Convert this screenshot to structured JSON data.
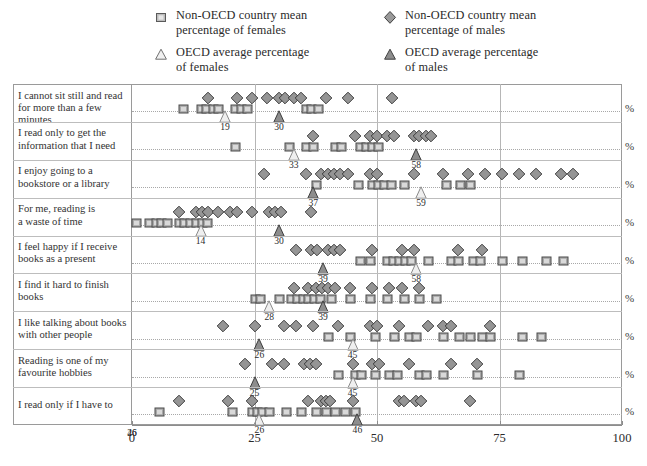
{
  "legend": {
    "items": [
      {
        "symbol": "square-light",
        "label": "Non-OECD country mean\npercentage of females",
        "name": "legend-nonoecd-females"
      },
      {
        "symbol": "diamond-dark",
        "label": "Non-OECD country mean\npercentage of males",
        "name": "legend-nonoecd-males"
      },
      {
        "symbol": "triangle-light",
        "label": "OECD average percentage\nof females",
        "name": "legend-oecd-females"
      },
      {
        "symbol": "triangle-dark",
        "label": "OECD average percentage\nof males",
        "name": "legend-oecd-males"
      }
    ]
  },
  "axis": {
    "ticks": [
      "0",
      "25",
      "50",
      "75",
      "100"
    ],
    "tick_values": [
      0,
      25,
      50,
      75,
      100
    ],
    "unit_label": "%",
    "extra_tick_labels": [
      {
        "value": 26,
        "text": "26"
      },
      {
        "value": 46,
        "text": "46"
      }
    ]
  },
  "chart_data": {
    "type": "scatter",
    "title": "",
    "xlabel": "%",
    "ylabel": "",
    "xlim": [
      0,
      100
    ],
    "grid": true,
    "legend_position": "top",
    "categories": [
      "I cannot sit still and read\nfor more than a few minutes",
      "I read only to get the\ninformation that I need",
      "I enjoy going to a\nbookstore or a library",
      "For me, reading is\na waste of time",
      "I feel happy if I receive\nbooks as a present",
      "I find it hard to finish\nbooks",
      "I like talking about books\nwith other people",
      "Reading is one of my\nfavourite hobbies",
      "I read only if I have to"
    ],
    "series": [
      {
        "name": "Non-OECD country mean percentage of females",
        "symbol": "square-light",
        "values": [
          [
            10.5,
            14.0,
            15.2,
            16.5,
            17.6,
            21.0,
            22.2,
            23.4,
            35.5,
            36.6,
            38.0
          ],
          [
            21.0,
            32.0,
            35.5,
            37.0,
            41.5,
            42.7,
            46.5,
            47.8,
            49.0,
            50.2
          ],
          [
            37.5,
            46.2,
            49.0,
            50.3,
            51.5,
            52.8,
            55.5,
            64.0,
            67.0,
            69.0
          ],
          [
            0.8,
            3.5,
            4.8,
            6.0,
            7.2,
            9.5,
            10.6,
            11.8,
            13.0,
            14.2,
            15.3
          ],
          [
            46.5,
            48.5,
            52.0,
            53.3,
            54.5,
            55.8,
            57.0,
            60.5,
            65.0,
            66.5,
            69.5,
            71.0,
            75.5,
            79.5,
            84.5,
            88.0
          ],
          [
            25.0,
            26.2,
            30.0,
            32.5,
            33.6,
            34.8,
            36.0,
            37.2,
            38.4,
            40.6,
            44.5,
            48.5,
            52.0,
            55.5,
            58.5,
            62.0
          ],
          [
            40.0,
            44.5,
            49.5,
            53.5,
            56.5,
            58.0,
            63.5,
            66.8,
            69.0,
            71.5,
            73.0,
            79.5,
            83.5
          ],
          [
            42.0,
            45.5,
            46.8,
            49.5,
            52.5,
            54.0,
            58.5,
            60.0,
            63.5,
            70.5,
            79.0
          ],
          [
            5.5,
            20.5,
            24.5,
            25.5,
            26.5,
            28.0,
            31.5,
            34.5,
            37.5,
            39.5,
            41.5,
            43.5,
            45.5
          ]
        ]
      },
      {
        "name": "Non-OECD country mean percentage of males",
        "symbol": "diamond-dark",
        "values": [
          [
            15.5,
            21.5,
            24.5,
            27.5,
            30.0,
            31.2,
            33.0,
            34.5,
            39.5,
            44.0,
            53.0
          ],
          [
            37.0,
            45.5,
            48.5,
            50.0,
            52.0,
            53.5,
            57.5,
            58.5,
            60.0,
            61.0
          ],
          [
            27.0,
            35.5,
            38.5,
            40.0,
            41.3,
            42.5,
            44.0,
            48.5,
            50.0,
            57.5,
            63.5,
            68.5,
            72.0,
            75.5,
            79.0,
            82.5,
            87.5,
            90.0
          ],
          [
            9.5,
            13.0,
            14.2,
            15.5,
            17.5,
            20.0,
            21.5,
            24.5,
            28.0,
            29.2,
            30.5,
            36.5
          ],
          [
            33.5,
            36.5,
            37.8,
            40.0,
            41.3,
            42.5,
            49.0,
            55.0,
            57.5,
            66.5,
            71.5
          ],
          [
            33.0,
            36.0,
            37.5,
            38.8,
            40.0,
            41.5,
            44.5,
            49.0,
            52.5,
            55.0,
            58.5
          ],
          [
            18.5,
            25.0,
            31.0,
            33.5,
            37.0,
            42.0,
            48.5,
            50.0,
            54.5,
            60.5,
            63.5,
            65.0,
            73.0
          ],
          [
            23.0,
            28.5,
            31.0,
            35.0,
            36.3,
            37.5,
            45.0,
            49.0,
            50.5,
            56.5,
            65.0,
            70.5
          ],
          [
            9.5,
            19.5,
            24.5,
            36.0,
            38.5,
            39.5,
            40.5,
            45.0,
            54.5,
            55.5,
            58.0,
            59.0,
            69.0
          ]
        ]
      },
      {
        "name": "OECD average percentage of females",
        "symbol": "triangle-light",
        "values": [
          19,
          33,
          59,
          14,
          58,
          28,
          45,
          45,
          26
        ]
      },
      {
        "name": "OECD average percentage of males",
        "symbol": "triangle-dark",
        "values": [
          30,
          58,
          37,
          30,
          39,
          39,
          26,
          25,
          46
        ]
      }
    ],
    "annotations": [
      [
        {
          "v": 19,
          "text": "19"
        },
        {
          "v": 30,
          "text": "30"
        }
      ],
      [
        {
          "v": 33,
          "text": "33"
        },
        {
          "v": 58,
          "text": "58"
        }
      ],
      [
        {
          "v": 37,
          "text": "37"
        },
        {
          "v": 59,
          "text": "59"
        }
      ],
      [
        {
          "v": 14,
          "text": "14"
        },
        {
          "v": 30,
          "text": "30"
        }
      ],
      [
        {
          "v": 39,
          "text": "39"
        },
        {
          "v": 58,
          "text": "58"
        }
      ],
      [
        {
          "v": 28,
          "text": "28"
        },
        {
          "v": 39,
          "text": "39"
        }
      ],
      [
        {
          "v": 26,
          "text": "26"
        },
        {
          "v": 45,
          "text": "45"
        }
      ],
      [
        {
          "v": 25,
          "text": "25"
        },
        {
          "v": 45,
          "text": "45"
        }
      ],
      [
        {
          "v": 26,
          "text": "26"
        },
        {
          "v": 46,
          "text": "46"
        }
      ]
    ]
  },
  "colors": {
    "marker_fill": "#9a9a9a",
    "marker_stroke": "#4a4a4a",
    "triangle_light_fill": "#d8d8d8",
    "triangle_dark_fill": "#8a8a8a",
    "frame": "#9a9a9a",
    "grid": "#b6b6b6"
  }
}
